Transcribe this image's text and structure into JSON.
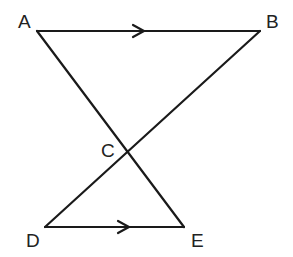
{
  "diagram": {
    "type": "geometry",
    "points": {
      "A": {
        "label": "A",
        "x": 37,
        "y": 31
      },
      "B": {
        "label": "B",
        "x": 260,
        "y": 31
      },
      "C": {
        "label": "C",
        "x": 128,
        "y": 151
      },
      "D": {
        "label": "D",
        "x": 45,
        "y": 227
      },
      "E": {
        "label": "E",
        "x": 184,
        "y": 227
      }
    },
    "segments": [
      "AB",
      "AE",
      "BD",
      "DE"
    ],
    "parallel_marks": [
      "AB",
      "DE"
    ],
    "stroke_color": "#1a1a1a",
    "background": "#ffffff"
  }
}
